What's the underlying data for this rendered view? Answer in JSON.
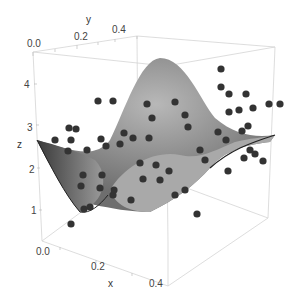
{
  "chart_data": {
    "type": "scatter3d_with_surface",
    "title": "",
    "xlabel": "x",
    "ylabel": "y",
    "zlabel": "z",
    "x_ticks": [
      "0.0",
      "0.2",
      "0.4"
    ],
    "y_ticks": [
      "0.0",
      "0.2",
      "0.4"
    ],
    "z_ticks": [
      "1",
      "2",
      "3",
      "4"
    ],
    "xlim": [
      0,
      0.55
    ],
    "ylim": [
      0,
      0.55
    ],
    "zlim": [
      0.5,
      4.8
    ],
    "surface": {
      "description": "Gaussian bump peaking near (x≈0.3, y≈0.3, z≈4.6), baseline ≈2.7 at edges",
      "peak": {
        "x": 0.3,
        "y": 0.3,
        "z": 4.6
      },
      "baseline_z": 2.7,
      "color": "#9a9a9a"
    },
    "points_screen": [
      [
        98,
        101
      ],
      [
        113,
        101
      ],
      [
        76,
        129
      ],
      [
        69,
        128
      ],
      [
        71,
        140
      ],
      [
        55,
        140
      ],
      [
        68,
        151
      ],
      [
        87,
        150
      ],
      [
        101,
        139
      ],
      [
        106,
        146
      ],
      [
        133,
        138
      ],
      [
        149,
        138
      ],
      [
        147,
        104
      ],
      [
        120,
        144
      ],
      [
        152,
        118
      ],
      [
        124,
        133
      ],
      [
        175,
        102
      ],
      [
        185,
        115
      ],
      [
        188,
        127
      ],
      [
        140,
        163
      ],
      [
        156,
        165
      ],
      [
        160,
        180
      ],
      [
        175,
        195
      ],
      [
        200,
        150
      ],
      [
        205,
        160
      ],
      [
        221,
        69
      ],
      [
        221,
        87
      ],
      [
        229,
        94
      ],
      [
        246,
        94
      ],
      [
        239,
        110
      ],
      [
        229,
        112
      ],
      [
        253,
        108
      ],
      [
        269,
        104
      ],
      [
        218,
        132
      ],
      [
        242,
        131
      ],
      [
        226,
        140
      ],
      [
        250,
        150
      ],
      [
        244,
        158
      ],
      [
        255,
        154
      ],
      [
        263,
        161
      ],
      [
        228,
        171
      ],
      [
        280,
        104
      ],
      [
        248,
        126
      ],
      [
        83,
        175
      ],
      [
        102,
        175
      ],
      [
        81,
        186
      ],
      [
        100,
        188
      ],
      [
        113,
        195
      ],
      [
        131,
        200
      ],
      [
        90,
        207
      ],
      [
        114,
        190
      ],
      [
        71,
        224
      ],
      [
        84,
        209
      ],
      [
        185,
        190
      ],
      [
        197,
        214
      ],
      [
        143,
        179
      ],
      [
        169,
        171
      ]
    ],
    "point_color": "#333333"
  },
  "labels": {
    "x_axis": "x",
    "y_axis": "y",
    "z_axis": "z",
    "x_tick_0": "0.0",
    "x_tick_1": "0.2",
    "x_tick_2": "0.4",
    "y_tick_0": "0.0",
    "y_tick_1": "0.2",
    "y_tick_2": "0.4",
    "z_tick_1": "1",
    "z_tick_2": "2",
    "z_tick_3": "3",
    "z_tick_4": "4"
  }
}
